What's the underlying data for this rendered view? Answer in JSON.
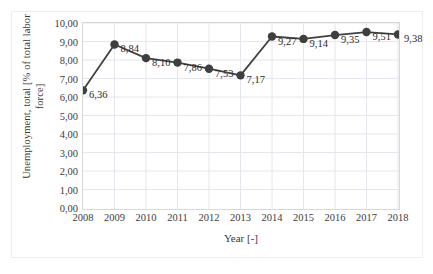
{
  "chart_data": {
    "type": "line",
    "title": "",
    "subtitle": "",
    "xlabel": "Year [-]",
    "ylabel": "Unemployment, total  [% of total labor force]",
    "ylabel_lines": [
      "Unemployment, total  [% of total labor",
      "force]"
    ],
    "x": [
      2008,
      2009,
      2010,
      2011,
      2012,
      2013,
      2014,
      2015,
      2016,
      2017,
      2018
    ],
    "categories": [
      "2008",
      "2009",
      "2010",
      "2011",
      "2012",
      "2013",
      "2014",
      "2015",
      "2016",
      "2017",
      "2018"
    ],
    "values": [
      6.36,
      8.84,
      8.1,
      7.86,
      7.53,
      7.17,
      9.27,
      9.14,
      9.35,
      9.51,
      9.38
    ],
    "data_labels": [
      "6,36",
      "8,84",
      "8,10",
      "7,86",
      "7,53",
      "7,17",
      "9,27",
      "9,14",
      "9,35",
      "9,51",
      "9,38"
    ],
    "xlim": [
      2008,
      2018
    ],
    "ylim": [
      0.0,
      10.0
    ],
    "ytick_values": [
      0.0,
      1.0,
      2.0,
      3.0,
      4.0,
      5.0,
      6.0,
      7.0,
      8.0,
      9.0,
      10.0
    ],
    "ytick_labels": [
      "0,00",
      "1,00",
      "2,00",
      "3,00",
      "4,00",
      "5,00",
      "6,00",
      "7,00",
      "8,00",
      "9,00",
      "10,00"
    ],
    "xtick_labels": [
      "2008",
      "2009",
      "2010",
      "2011",
      "2012",
      "2013",
      "2014",
      "2015",
      "2016",
      "2017",
      "2018"
    ],
    "grid": {
      "horizontal": true,
      "vertical": true,
      "color": "#e6e6ee"
    },
    "legend": {
      "visible": false,
      "position": "none"
    },
    "series_style": {
      "line_color": "#404040",
      "line_width": 1.8,
      "marker": "circle",
      "marker_color": "#3f3f3f",
      "marker_size": 4.2
    },
    "decimal_separator": ",",
    "label_placement": "right-of-marker"
  }
}
